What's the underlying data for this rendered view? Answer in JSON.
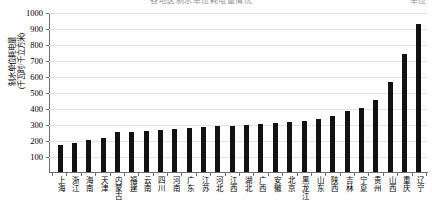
{
  "title_strip": {
    "main": "各地区制水单位耗电量情况",
    "right": "单位"
  },
  "axis": {
    "ylabel_line1": "制水单位耗电量",
    "ylabel_line2": "(千瓦时/千立方米)",
    "yticks": [
      0,
      100,
      200,
      300,
      400,
      500,
      600,
      700,
      800,
      900,
      1000
    ]
  },
  "chart_data": {
    "type": "bar",
    "title": "各地区制水单位耗电量情况",
    "xlabel": "",
    "ylabel": "制水单位耗电量（千瓦时/千立方米）",
    "ylim": [
      0,
      1000
    ],
    "ytick_step": 100,
    "grid": true,
    "legend": "none",
    "bar_color": "#121212",
    "categories": [
      "上海",
      "浙江",
      "海南",
      "天津",
      "内蒙古",
      "福建",
      "云南",
      "四川",
      "河南",
      "广东",
      "江苏",
      "河北",
      "江西",
      "湖北",
      "广西",
      "安徽",
      "北京",
      "黑龙江",
      "山东",
      "陕西",
      "吉林",
      "宁夏",
      "贵州",
      "山西",
      "重庆",
      "辽宁"
    ],
    "values": [
      170,
      180,
      200,
      210,
      250,
      250,
      255,
      260,
      270,
      275,
      280,
      285,
      290,
      295,
      300,
      305,
      310,
      320,
      330,
      350,
      380,
      400,
      450,
      560,
      740,
      925
    ]
  }
}
